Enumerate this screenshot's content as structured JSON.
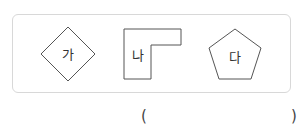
{
  "shapes": [
    {
      "label": "가",
      "type": "rhombus"
    },
    {
      "label": "나",
      "type": "l-shape"
    },
    {
      "label": "다",
      "type": "pentagon"
    }
  ],
  "answer": {
    "open_paren": "(",
    "close_paren": ")",
    "value": ""
  },
  "colors": {
    "stroke": "#555555",
    "box_border": "#d8d8d8"
  }
}
